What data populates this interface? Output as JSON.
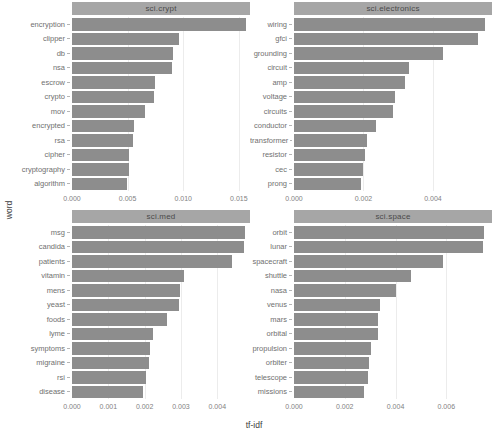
{
  "axis_titles": {
    "y": "word",
    "x": "tf-idf"
  },
  "colors": {
    "bar": "#8d8d8d",
    "strip_bg": "#a6a6a6",
    "strip_text": "#4a4a4a",
    "gridline": "#ececec",
    "background": "#ffffff",
    "axis_text": "#828282",
    "label_text": "#707070"
  },
  "chart_data": {
    "type": "bar",
    "orientation": "horizontal",
    "layout": "facet_wrap 2x2, free scales",
    "xlabel": "tf-idf",
    "ylabel": "word",
    "grid": "faint vertical gridlines at x ticks",
    "legend": "none",
    "facets": [
      {
        "title": "sci.crypt",
        "xmax": 0.016,
        "ticks": [
          0,
          0.005,
          0.01,
          0.015
        ],
        "tick_labels": [
          "0.000",
          "0.005",
          "0.010",
          "0.015"
        ],
        "words": [
          "encryption",
          "clipper",
          "db",
          "nsa",
          "escrow",
          "crypto",
          "mov",
          "encrypted",
          "rsa",
          "cipher",
          "cryptography",
          "algorithm"
        ],
        "values": [
          0.0156,
          0.0096,
          0.0091,
          0.009,
          0.0075,
          0.0074,
          0.0066,
          0.0056,
          0.0055,
          0.0051,
          0.0051,
          0.0049
        ]
      },
      {
        "title": "sci.electronics",
        "xmax": 0.0057,
        "ticks": [
          0,
          0.002,
          0.004
        ],
        "tick_labels": [
          "0.000",
          "0.002",
          "0.004"
        ],
        "words": [
          "wiring",
          "gfci",
          "grounding",
          "circuit",
          "amp",
          "voltage",
          "circuits",
          "conductor",
          "transformer",
          "resistor",
          "cec",
          "prong"
        ],
        "values": [
          0.0055,
          0.0053,
          0.0043,
          0.0033,
          0.0032,
          0.0029,
          0.00285,
          0.00235,
          0.0021,
          0.00205,
          0.00198,
          0.00193
        ]
      },
      {
        "title": "sci.med",
        "xmax": 0.0049,
        "ticks": [
          0,
          0.001,
          0.002,
          0.003,
          0.004
        ],
        "tick_labels": [
          "0.000",
          "0.001",
          "0.002",
          "0.003",
          "0.004"
        ],
        "words": [
          "msg",
          "candida",
          "patients",
          "vitamin",
          "mens",
          "yeast",
          "foods",
          "lyme",
          "symptoms",
          "migraine",
          "rsi",
          "disease"
        ],
        "values": [
          0.00475,
          0.00473,
          0.0044,
          0.00307,
          0.00298,
          0.00294,
          0.00261,
          0.00223,
          0.00216,
          0.00212,
          0.00203,
          0.00196
        ]
      },
      {
        "title": "sci.space",
        "xmax": 0.0078,
        "ticks": [
          0,
          0.002,
          0.004,
          0.006
        ],
        "tick_labels": [
          "0.000",
          "0.002",
          "0.004",
          "0.006"
        ],
        "words": [
          "orbit",
          "lunar",
          "spacecraft",
          "shuttle",
          "nasa",
          "venus",
          "mars",
          "orbital",
          "propulsion",
          "orbiter",
          "telescope",
          "missions"
        ],
        "values": [
          0.0075,
          0.00745,
          0.00585,
          0.0046,
          0.00402,
          0.0034,
          0.00332,
          0.0033,
          0.00304,
          0.00296,
          0.00292,
          0.00276
        ]
      }
    ]
  }
}
